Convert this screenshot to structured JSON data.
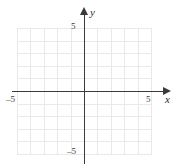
{
  "figure": {
    "axis_labels": {
      "x": "x",
      "y": "y"
    },
    "tick_labels": {
      "x_negative": "–5",
      "x_positive": "5",
      "y_positive": "5",
      "y_negative": "–5"
    },
    "colors": {
      "grid": "#e9e9e9",
      "axis": "#3a3a3a",
      "text": "#2b2b2b",
      "background": "#ffffff"
    }
  },
  "chart_data": {
    "type": "scatter",
    "title": "",
    "xlabel": "x",
    "ylabel": "y",
    "xlim": [
      -5,
      5
    ],
    "ylim": [
      -5,
      5
    ],
    "xticks": [
      -5,
      5
    ],
    "yticks": [
      -5,
      5
    ],
    "xtick_labels": [
      "–5",
      "5"
    ],
    "ytick_labels": [
      "–5",
      "5"
    ],
    "grid": true,
    "grid_step": 1,
    "grid_columns": 10,
    "grid_rows": 10,
    "legend": null,
    "series": [],
    "annotations": []
  }
}
